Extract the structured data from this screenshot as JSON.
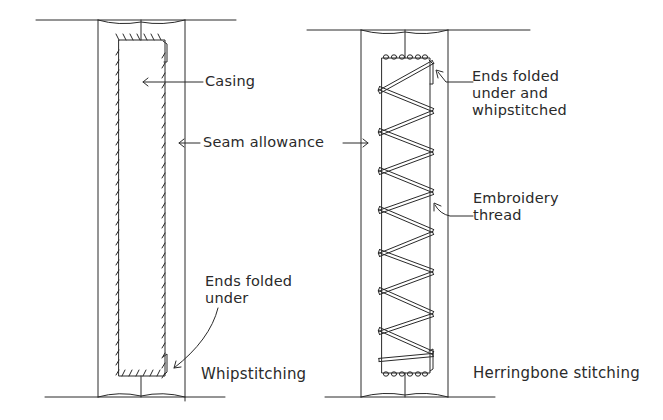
{
  "figure": {
    "type": "technical sewing illustration",
    "panels": [
      {
        "id": "left",
        "caption": "Whipstitching",
        "labels": {
          "casing": "Casing",
          "seam_allowance": "Seam allowance",
          "ends_folded": "Ends folded\nunder"
        }
      },
      {
        "id": "right",
        "caption": "Herringbone stitching",
        "labels": {
          "ends_folded_whipstitched": "Ends folded\nunder and\nwhipstitched",
          "embroidery_thread": "Embroidery\nthread"
        }
      }
    ],
    "colors": {
      "ink": "#2a2a2a",
      "background": "#ffffff"
    }
  }
}
